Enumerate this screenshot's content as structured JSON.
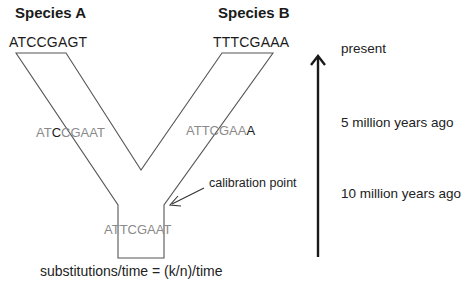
{
  "species": {
    "a": {
      "title": "Species A",
      "sequence": "ATCCGAGT"
    },
    "b": {
      "title": "Species B",
      "sequence": "TTTCGAAA"
    }
  },
  "branch_sequences": {
    "left": {
      "prefix": "AT",
      "highlight": "C",
      "suffix": "CGAAT",
      "full": "ATCCGAAT"
    },
    "right": {
      "prefix": "ATTCGAA",
      "highlight": "A",
      "suffix": "",
      "full": "ATTCGAAA"
    },
    "ancestor": {
      "full": "ATTCGAAT"
    }
  },
  "timeline": {
    "labels": [
      "present",
      "5 million years ago",
      "10 million years ago"
    ],
    "arrow_direction": "up"
  },
  "callout": {
    "label": "calibration point"
  },
  "formula": {
    "text": "substitutions/time = (k/n)/time"
  },
  "colors": {
    "line": "#555555",
    "arrow": "#222222",
    "text_dark": "#1a1a1a",
    "text_faded": "#8a8a8a"
  }
}
